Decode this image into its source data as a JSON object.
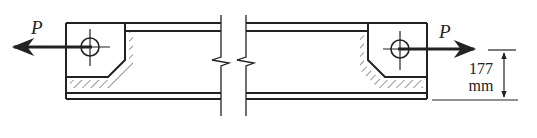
{
  "figure": {
    "type": "engineering-diagram",
    "colors": {
      "ink": "#222222",
      "background": "#ffffff"
    },
    "loads": [
      {
        "id": "left",
        "label": "P",
        "direction": "left"
      },
      {
        "id": "right",
        "label": "P",
        "direction": "right"
      }
    ],
    "dimension": {
      "value": "177",
      "unit": "mm"
    },
    "break_symbol": "double zigzag break line"
  }
}
